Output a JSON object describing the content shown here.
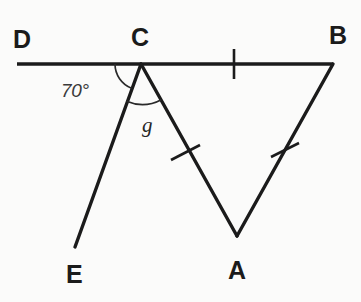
{
  "diagram": {
    "type": "geometry-figure",
    "background_color": "#fbfbfa",
    "stroke_color": "#1b1b1b",
    "vertices": [
      {
        "name": "D",
        "label": "D",
        "x": 17,
        "y": 64,
        "label_x": 13,
        "label_y": 27
      },
      {
        "name": "C",
        "label": "C",
        "x": 141,
        "y": 64,
        "label_x": 131,
        "label_y": 25
      },
      {
        "name": "B",
        "label": "B",
        "x": 333,
        "y": 64,
        "label_x": 329,
        "label_y": 23
      },
      {
        "name": "A",
        "label": "A",
        "x": 237,
        "y": 236,
        "label_x": 228,
        "label_y": 258
      },
      {
        "name": "E",
        "label": "E",
        "x": 75,
        "y": 247,
        "label_x": 66,
        "label_y": 262
      }
    ],
    "segments": [
      {
        "name": "line-DB",
        "from": "D",
        "to": "B"
      },
      {
        "name": "segment-CE",
        "from": "C",
        "to": "E"
      },
      {
        "name": "segment-CA",
        "from": "C",
        "to": "A"
      },
      {
        "name": "segment-AB",
        "from": "A",
        "to": "B"
      }
    ],
    "tick_marks": [
      {
        "name": "tick-CB",
        "on": "segment-CB",
        "x": 234,
        "y": 64,
        "angle": 0
      },
      {
        "name": "tick-CA",
        "on": "segment-CA",
        "x": 186,
        "y": 153,
        "angle": 45
      },
      {
        "name": "tick-AB",
        "on": "segment-AB",
        "x": 285,
        "y": 150,
        "angle": -60
      }
    ],
    "angles": [
      {
        "name": "angle-70",
        "label": "70°",
        "vertex": "C",
        "between": [
          "D",
          "E"
        ],
        "radius": 26,
        "label_x": 61,
        "label_y": 81
      },
      {
        "name": "angle-g",
        "label": "g",
        "vertex": "C",
        "between": [
          "E",
          "A"
        ],
        "radius": 40,
        "label_x": 142,
        "label_y": 115
      }
    ]
  }
}
